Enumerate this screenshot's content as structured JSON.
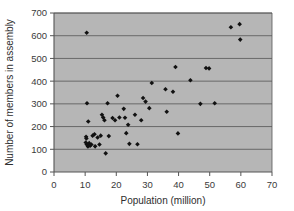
{
  "chart_data": {
    "type": "scatter",
    "title": "",
    "xlabel": "Population (million)",
    "ylabel": "Number of members in assembly",
    "xlim": [
      0,
      70
    ],
    "ylim": [
      0,
      700
    ],
    "xticks": [
      0,
      10,
      20,
      30,
      40,
      50,
      60,
      70
    ],
    "yticks": [
      0,
      100,
      200,
      300,
      400,
      500,
      600,
      700
    ],
    "grid": "horizontal",
    "legend": "none",
    "plot_background_color": "#b6b6b6",
    "marker_color": "#111111",
    "marker_shape": "diamond",
    "points": [
      {
        "x": 10.5,
        "y": 613
      },
      {
        "x": 10.6,
        "y": 303
      },
      {
        "x": 11.0,
        "y": 222
      },
      {
        "x": 10.3,
        "y": 155
      },
      {
        "x": 10.4,
        "y": 148
      },
      {
        "x": 10.2,
        "y": 130
      },
      {
        "x": 10.5,
        "y": 122
      },
      {
        "x": 10.8,
        "y": 118
      },
      {
        "x": 10.9,
        "y": 112
      },
      {
        "x": 11.3,
        "y": 127
      },
      {
        "x": 11.6,
        "y": 116
      },
      {
        "x": 12.0,
        "y": 121
      },
      {
        "x": 12.4,
        "y": 160
      },
      {
        "x": 13.0,
        "y": 166
      },
      {
        "x": 13.2,
        "y": 113
      },
      {
        "x": 14.0,
        "y": 152
      },
      {
        "x": 14.6,
        "y": 121
      },
      {
        "x": 15.0,
        "y": 160
      },
      {
        "x": 15.4,
        "y": 252
      },
      {
        "x": 15.8,
        "y": 240
      },
      {
        "x": 16.2,
        "y": 228
      },
      {
        "x": 16.6,
        "y": 82
      },
      {
        "x": 17.2,
        "y": 303
      },
      {
        "x": 17.6,
        "y": 158
      },
      {
        "x": 18.8,
        "y": 238
      },
      {
        "x": 19.6,
        "y": 228
      },
      {
        "x": 20.4,
        "y": 336
      },
      {
        "x": 21.0,
        "y": 240
      },
      {
        "x": 22.4,
        "y": 278
      },
      {
        "x": 22.8,
        "y": 239
      },
      {
        "x": 23.2,
        "y": 171
      },
      {
        "x": 23.8,
        "y": 208
      },
      {
        "x": 24.2,
        "y": 124
      },
      {
        "x": 26.0,
        "y": 252
      },
      {
        "x": 26.8,
        "y": 122
      },
      {
        "x": 28.0,
        "y": 228
      },
      {
        "x": 28.6,
        "y": 326
      },
      {
        "x": 29.4,
        "y": 310
      },
      {
        "x": 30.6,
        "y": 281
      },
      {
        "x": 31.4,
        "y": 392
      },
      {
        "x": 35.8,
        "y": 364
      },
      {
        "x": 36.2,
        "y": 265
      },
      {
        "x": 38.2,
        "y": 353
      },
      {
        "x": 39.0,
        "y": 462
      },
      {
        "x": 39.8,
        "y": 170
      },
      {
        "x": 43.8,
        "y": 404
      },
      {
        "x": 47.0,
        "y": 300
      },
      {
        "x": 48.8,
        "y": 458
      },
      {
        "x": 49.8,
        "y": 456
      },
      {
        "x": 51.6,
        "y": 303
      },
      {
        "x": 56.8,
        "y": 637
      },
      {
        "x": 59.6,
        "y": 651
      },
      {
        "x": 59.8,
        "y": 583
      }
    ]
  }
}
